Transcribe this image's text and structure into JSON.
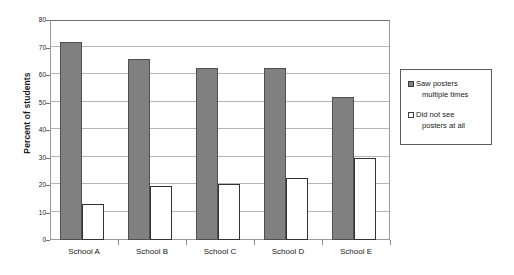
{
  "chart_data": {
    "type": "bar",
    "title": "",
    "xlabel": "",
    "ylabel": "Percent of students",
    "ylim": [
      0,
      80
    ],
    "ytick_step": 10,
    "yticks": [
      0,
      10,
      20,
      30,
      40,
      50,
      60,
      70,
      80
    ],
    "grid": true,
    "legend_position": "right",
    "categories": [
      "School A",
      "School B",
      "School C",
      "School D",
      "School E"
    ],
    "series": [
      {
        "name": "Saw posters multiple times",
        "name_line1": "Saw posters",
        "name_line2": "multiple times",
        "color": "#808080",
        "values": [
          72,
          66,
          62.5,
          62.5,
          52
        ]
      },
      {
        "name": "Did not see posters at all",
        "name_line1": "Did not see",
        "name_line2": "posters  at all",
        "color": "#ffffff",
        "values": [
          13,
          19.8,
          20.4,
          22.6,
          30
        ]
      }
    ]
  },
  "colors": {
    "series_gray": "#808080",
    "series_white": "#ffffff",
    "bar_border_gray": "#4f4f4f",
    "bar_border_white": "#333333",
    "gridline": "#b6b6b6",
    "axis": "#6f6f6f",
    "text": "#1a1a1a",
    "background": "#ffffff"
  }
}
